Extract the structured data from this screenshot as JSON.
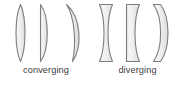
{
  "diagram": {
    "background_color": "#ffffff",
    "lens_fill_color": "#ececec",
    "lens_fill_highlight": "#fafafa",
    "lens_fill_shadow": "#d8d8d8",
    "lens_stroke_color": "#7d7d7d",
    "label_color": "#3c3c3c",
    "groups": [
      {
        "id": "converging",
        "label": "converging",
        "lenses": [
          {
            "id": "biconvex",
            "name": "biconvex"
          },
          {
            "id": "plano-convex",
            "name": "plano-convex"
          },
          {
            "id": "positive-meniscus",
            "name": "positive meniscus"
          }
        ]
      },
      {
        "id": "diverging",
        "label": "diverging",
        "lenses": [
          {
            "id": "biconcave",
            "name": "biconcave"
          },
          {
            "id": "plano-concave",
            "name": "plano-concave"
          },
          {
            "id": "negative-meniscus",
            "name": "negative meniscus"
          }
        ]
      }
    ]
  }
}
